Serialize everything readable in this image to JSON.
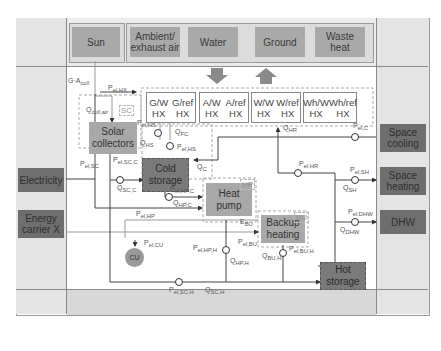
{
  "sources": [
    "Sun",
    "Ambient/ exhaust air",
    "Water",
    "Ground",
    "Waste heat"
  ],
  "heat_exchangers": [
    {
      "line1": "G/W HX",
      "line2": "G/ref HX"
    },
    {
      "line1": "A/W HX",
      "line2": "A/ref HX"
    },
    {
      "line1": "W/W HX",
      "line2": "W/ref HX"
    },
    {
      "line1": "Wh/W HX",
      "line2": "Wh/ref HX"
    }
  ],
  "inputs": [
    "Electricity",
    "Energy carrier X"
  ],
  "outputs": [
    "Space cooling",
    "Space heating",
    "DHW"
  ],
  "components": {
    "solar_collectors": "Solar collectors",
    "cold_storage": "Cold storage",
    "heat_pump": "Heat pump",
    "backup_heating": "Backup heating",
    "hot_storage": "Hot storage",
    "cu": "CU"
  },
  "tags": {
    "sc": "SC",
    "hp": "HP",
    "bu": "BU"
  },
  "labels": {
    "g_acoll": "G·A",
    "g_acoll_sub": "coll",
    "pel_hx": "P",
    "pel_hx_sub": "el,HX",
    "qcoll_air": "Q",
    "qcoll_air_sub": "coll,air",
    "pel_sc": "P",
    "pel_sc_sub": "el,SC",
    "pel_hs1": "P",
    "pel_hs1_sub": "el,HS",
    "qhs": "Q",
    "qhs_sub": "HS",
    "qfc": "Q",
    "qfc_sub": "FC",
    "pel_hs2": "P",
    "pel_hs2_sub": "el,HS",
    "pel_scc": "P",
    "pel_scc_sub": "el,SC,C",
    "qscc": "Q",
    "qscc_sub": "SC,C",
    "qc": "Q",
    "qc_sub": "C",
    "qhr": "Q",
    "qhr_sub": "HR",
    "pel_c": "P",
    "pel_c_sub": "el,C",
    "pel_hr": "P",
    "pel_hr_sub": "el,HR",
    "pel_sh": "P",
    "pel_sh_sub": "el,SH",
    "qsh": "Q",
    "qsh_sub": "SH",
    "pel_hpc": "P",
    "pel_hpc_sub": "el,HP,C",
    "qhpc": "Q",
    "qhpc_sub": "HP,C",
    "pel_hp": "P",
    "pel_hp_sub": "el,HP",
    "ebu": "E",
    "ebu_sub": "BU",
    "pel_dhw": "P",
    "pel_dhw_sub": "el,DHW",
    "qdhw": "Q",
    "qdhw_sub": "DHW",
    "pel_cu": "P",
    "pel_cu_sub": "el,CU",
    "pel_bu": "P",
    "pel_bu_sub": "el,BU",
    "pel_hph": "P",
    "pel_hph_sub": "el,HP,H",
    "qhph": "Q",
    "qhph_sub": "HP,H",
    "qbuh": "Q",
    "qbuh_sub": "BU,H",
    "pel_buh": "P",
    "pel_buh_sub": "el,BU,H",
    "pel_sch": "P",
    "pel_sch_sub": "el,SC,H",
    "qsch": "Q",
    "qsch_sub": "SC,H"
  },
  "colors": {
    "source": "#a9a9a9",
    "storage": "#7a7a7a",
    "side": "#6e6e6e",
    "line": "#444444"
  }
}
